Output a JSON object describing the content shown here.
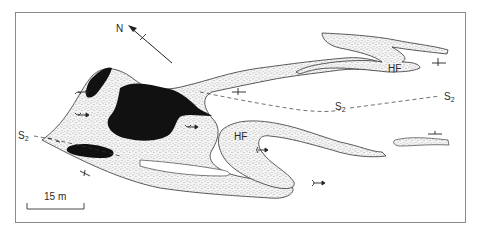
{
  "figure": {
    "type": "geological-map",
    "frame_color": "#8a8a8a",
    "ink_color": "#1a1a1a",
    "stipple_color": "#555555"
  },
  "north_arrow": {
    "label": "N"
  },
  "labels": {
    "s2_left": "S",
    "s2_left_sub": "2",
    "s2_middle": "S",
    "s2_middle_sub": "2",
    "s2_right": "S",
    "s2_right_sub": "2",
    "hf_upper": "HF",
    "hf_lower": "HF"
  },
  "scale_bar": {
    "label": "15 m"
  },
  "legend_units": [
    {
      "name": "stippled-layer",
      "fill": "stipple"
    },
    {
      "name": "black-layer",
      "fill": "#111111"
    }
  ],
  "symbols": [
    "fold-vergence-arrow",
    "fold-vergence-arrow",
    "fold-vergence-arrow",
    "fold-vergence-arrow",
    "fold-vergence-arrow",
    "strike-dip-symbol",
    "strike-dip-symbol",
    "strike-dip-symbol",
    "strike-dip-symbol",
    "strike-dip-symbol"
  ]
}
